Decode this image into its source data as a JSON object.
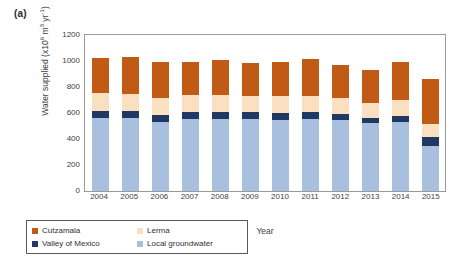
{
  "panel": {
    "label": "(a)"
  },
  "chart_data": {
    "type": "bar",
    "subtype": "stacked-bar",
    "title": "",
    "xlabel": "Year",
    "ylabel": "Water supplied (x10⁶ m³ yr⁻¹)",
    "ylabel_parts": {
      "text": "Water supplied (x10",
      "sup1": "6",
      "mid": " m",
      "sup2": "3",
      "mid2": " yr",
      "sup3": "-1",
      "tail": ")"
    },
    "ylim": [
      0,
      1200
    ],
    "yticks": [
      0,
      200,
      400,
      600,
      800,
      1000,
      1200
    ],
    "ytick_labels": [
      "0",
      "200",
      "400",
      "600",
      "800",
      "1000",
      "1200"
    ],
    "grid": false,
    "legend_position": "below-left",
    "categories": [
      "2004",
      "2005",
      "2006",
      "2007",
      "2008",
      "2009",
      "2010",
      "2011",
      "2012",
      "2013",
      "2014",
      "2015"
    ],
    "stack_order_bottom_to_top": [
      "Local groundwater",
      "Valley of Mexico",
      "Lerma",
      "Cutzamala"
    ],
    "series": [
      {
        "name": "Local groundwater",
        "color": "#A8C0DE",
        "values": [
          560,
          560,
          530,
          555,
          555,
          555,
          550,
          555,
          545,
          520,
          530,
          345
        ]
      },
      {
        "name": "Valley of Mexico",
        "color": "#1F3864",
        "values": [
          55,
          55,
          55,
          50,
          50,
          50,
          50,
          50,
          50,
          45,
          50,
          70
        ]
      },
      {
        "name": "Lerma",
        "color": "#FAE0C0",
        "values": [
          140,
          135,
          130,
          135,
          130,
          125,
          130,
          125,
          120,
          110,
          120,
          100
        ]
      },
      {
        "name": "Cutzamala",
        "color": "#C05A14",
        "values": [
          265,
          280,
          275,
          255,
          270,
          255,
          260,
          285,
          255,
          255,
          290,
          345
        ]
      }
    ],
    "totals": [
      1020,
      1030,
      990,
      995,
      1005,
      985,
      990,
      1015,
      970,
      930,
      990,
      860
    ]
  },
  "legend": {
    "items": [
      {
        "label": "Cutzamala",
        "color": "#C05A14"
      },
      {
        "label": "Lerma",
        "color": "#FAE0C0"
      },
      {
        "label": "Valley of Mexico",
        "color": "#1F3864"
      },
      {
        "label": "Local groundwater",
        "color": "#A8C0DE"
      }
    ]
  }
}
